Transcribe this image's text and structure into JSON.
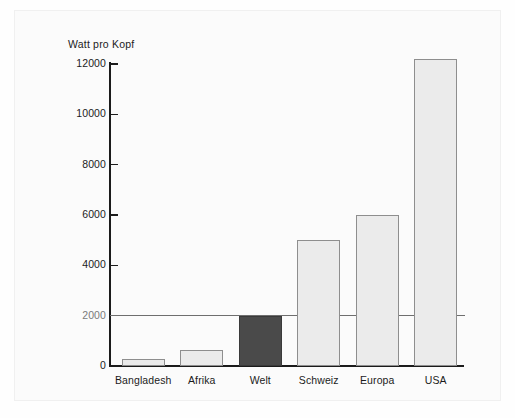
{
  "chart_data": {
    "type": "bar",
    "title": "",
    "ylabel": "Watt pro Kopf",
    "xlabel": "",
    "categories": [
      "Bangladesh",
      "Afrika",
      "Welt",
      "Schweiz",
      "Europa",
      "USA"
    ],
    "values": [
      280,
      650,
      2000,
      5000,
      6000,
      12200
    ],
    "yticks": [
      0,
      2000,
      4000,
      6000,
      8000,
      10000,
      12000
    ],
    "ytick_labels": [
      "0",
      "2000",
      "4000",
      "6000",
      "8000",
      "10000",
      "12000"
    ],
    "ylim": [
      0,
      12200
    ],
    "grid": false,
    "legend": "none",
    "reference_line": {
      "value": 2000,
      "label": "2000",
      "color": "#6e6e6e"
    },
    "highlight_category": "Welt",
    "colors": {
      "bar_fill": "#ebebeb",
      "bar_border": "#8e8e8e",
      "highlight_fill": "#4a4a4a",
      "axis": "#1b1b1b",
      "background": "#fbfbfb",
      "text": "#1b1b1b"
    }
  }
}
